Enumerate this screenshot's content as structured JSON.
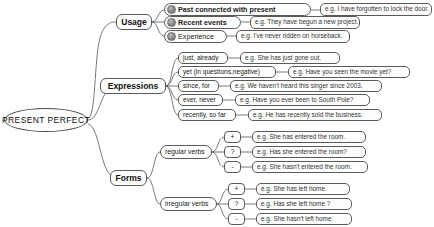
{
  "diagram": {
    "title": "PRESENT PERFECT",
    "type": "mind-map",
    "background": "#ffffff",
    "line_color": "#555555"
  },
  "root": {
    "label": "PRESENT PERFECT"
  },
  "branches": [
    {
      "id": "usage",
      "label": "Usage",
      "items": [
        {
          "icon": "circle-badge-icon",
          "label": "Past connected with present",
          "example": "e.g. I have forgotten to lock the door."
        },
        {
          "icon": "circle-badge-icon",
          "label": "Recent events",
          "example": "e.g. They have begun a new project."
        },
        {
          "icon": "circle-badge-icon",
          "label": "Experience",
          "example": "e.g. I've never ridden on horseback."
        }
      ]
    },
    {
      "id": "expressions",
      "label": "Expressions",
      "items": [
        {
          "label": "just, already",
          "example": "e.g. She has just gone out."
        },
        {
          "label": "yet (in questions,negative)",
          "example": "e.g. Have you seen the movie yet?"
        },
        {
          "label": "since, for",
          "example": "e.g. We haven't heard this singer since 2003."
        },
        {
          "label": "ever, never",
          "example": "e.g. Have you ever been to South Pole?"
        },
        {
          "label": "recently, so far",
          "example": "e.g. He has recently sold the business."
        }
      ]
    },
    {
      "id": "forms",
      "label": "Forms",
      "groups": [
        {
          "label": "regular verbs",
          "rows": [
            {
              "op": "+",
              "example": "e.g. She has entered the room."
            },
            {
              "op": "?",
              "example": "e.g. Has she entered the room?"
            },
            {
              "op": "-",
              "example": "e.g. She hasn't entered the room."
            }
          ]
        },
        {
          "label": "irregular verbs",
          "rows": [
            {
              "op": "+",
              "example": "e.g. She has left home."
            },
            {
              "op": "?",
              "example": "e.g. Has she left home ?"
            },
            {
              "op": "-",
              "example": "e.g. She hasn't left home."
            }
          ]
        }
      ]
    }
  ]
}
